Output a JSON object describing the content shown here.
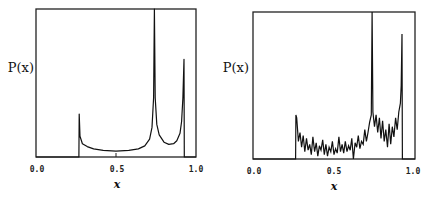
{
  "chart_data": [
    {
      "type": "line",
      "title": "",
      "xlabel": "x",
      "ylabel": "P(x)",
      "xlim": [
        0.0,
        1.0
      ],
      "x_ticks": [
        "0.0",
        "0.5",
        "1.0"
      ],
      "grid": false,
      "legend": null,
      "description": "Smooth density with edge at x≈0.27, broad low plateau, sharp divergent peak at x≈0.74 (clipped at top), dip around x≈0.85, peak at x≈0.925 then drop to zero",
      "series": [
        {
          "name": "P(x) theoretical",
          "x": [
            0.0,
            0.268,
            0.27,
            0.275,
            0.29,
            0.32,
            0.36,
            0.42,
            0.5,
            0.58,
            0.64,
            0.68,
            0.71,
            0.725,
            0.735,
            0.74,
            0.745,
            0.755,
            0.77,
            0.8,
            0.83,
            0.86,
            0.88,
            0.9,
            0.91,
            0.918,
            0.925,
            0.927,
            1.0
          ],
          "y": [
            0.0,
            0.0,
            0.29,
            0.14,
            0.09,
            0.07,
            0.055,
            0.045,
            0.04,
            0.045,
            0.055,
            0.075,
            0.12,
            0.2,
            0.4,
            1.0,
            0.4,
            0.22,
            0.15,
            0.1,
            0.085,
            0.09,
            0.11,
            0.16,
            0.24,
            0.4,
            0.66,
            0.0,
            0.0
          ]
        }
      ]
    },
    {
      "type": "line",
      "title": "",
      "xlabel": "x",
      "ylabel": "P(x)",
      "xlim": [
        0.0,
        1.0
      ],
      "x_ticks": [
        "0.0",
        "0.5",
        "1.0"
      ],
      "grid": false,
      "legend": null,
      "description": "Noisy histogram-like density: edge at x≈0.265, noisy low plateau, sharp peak at x≈0.735 (clipped), elevated noisy region 0.74–0.9, peak at x≈0.92 then drop to zero",
      "series": [
        {
          "name": "P(x) numerical",
          "x": [
            0.0,
            0.263,
            0.265,
            0.27,
            0.28,
            0.29,
            0.3,
            0.31,
            0.32,
            0.33,
            0.34,
            0.35,
            0.36,
            0.37,
            0.38,
            0.39,
            0.4,
            0.41,
            0.42,
            0.43,
            0.44,
            0.45,
            0.46,
            0.47,
            0.48,
            0.49,
            0.5,
            0.51,
            0.52,
            0.53,
            0.54,
            0.55,
            0.56,
            0.57,
            0.58,
            0.59,
            0.6,
            0.61,
            0.62,
            0.63,
            0.64,
            0.65,
            0.66,
            0.67,
            0.68,
            0.69,
            0.7,
            0.71,
            0.72,
            0.73,
            0.735,
            0.74,
            0.75,
            0.76,
            0.77,
            0.78,
            0.79,
            0.8,
            0.81,
            0.82,
            0.83,
            0.84,
            0.85,
            0.86,
            0.87,
            0.88,
            0.89,
            0.9,
            0.91,
            0.915,
            0.92,
            0.922,
            1.0
          ],
          "y": [
            0.0,
            0.0,
            0.3,
            0.28,
            0.12,
            0.18,
            0.08,
            0.16,
            0.05,
            0.14,
            0.06,
            0.1,
            0.03,
            0.15,
            0.05,
            0.11,
            0.02,
            0.09,
            0.06,
            0.13,
            0.03,
            0.1,
            0.02,
            0.08,
            0.05,
            0.12,
            0.03,
            0.07,
            0.04,
            0.15,
            0.05,
            0.1,
            0.04,
            0.12,
            0.05,
            0.09,
            0.06,
            0.14,
            0.0,
            0.11,
            0.08,
            0.16,
            0.07,
            0.12,
            0.1,
            0.2,
            0.12,
            0.18,
            0.25,
            0.3,
            1.0,
            0.32,
            0.22,
            0.3,
            0.18,
            0.28,
            0.14,
            0.26,
            0.12,
            0.2,
            0.08,
            0.24,
            0.1,
            0.22,
            0.15,
            0.28,
            0.2,
            0.32,
            0.38,
            0.5,
            0.85,
            0.0,
            0.0
          ]
        }
      ]
    }
  ],
  "labels": {
    "ylabel_left": "P(x)",
    "ylabel_right": "P(x)",
    "xlabel_left": "x",
    "xlabel_right": "x",
    "tick_0": "0.0",
    "tick_05": "0.5",
    "tick_1": "1.0"
  }
}
